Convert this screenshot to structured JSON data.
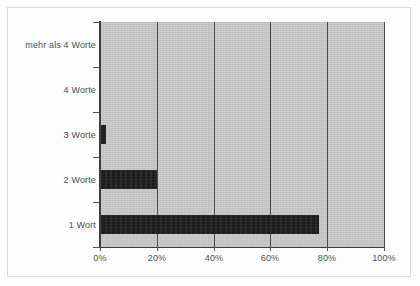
{
  "chart_data": {
    "type": "bar",
    "orientation": "horizontal",
    "title": "",
    "subtitle": "",
    "xlabel": "",
    "ylabel": "",
    "categories": [
      "1 Wort",
      "2 Worte",
      "3 Worte",
      "4 Worte",
      "mehr als 4 Worte"
    ],
    "values": [
      77,
      20,
      2,
      0,
      0
    ],
    "value_unit": "%",
    "xlim": [
      0,
      100
    ],
    "xticks": [
      0,
      20,
      40,
      60,
      80,
      100
    ],
    "xtick_labels": [
      "0%",
      "20%",
      "40%",
      "60%",
      "80%",
      "100%"
    ],
    "grid": "vertical",
    "legend": "none",
    "series": [
      {
        "name": "Anteil",
        "values": [
          77,
          20,
          2,
          0,
          0
        ]
      }
    ],
    "colors": {
      "bar": "#1c1c1c",
      "plot_background": "#c9c9c9",
      "gridline": "#4a4a4a",
      "axis": "#3c3c3c",
      "tick_label": "#4f4f4f",
      "figure_background": "#fdfdfd"
    }
  },
  "axis": {
    "y_categories": [
      {
        "label": "mehr als 4 Worte",
        "value": 0
      },
      {
        "label": "4 Worte",
        "value": 0
      },
      {
        "label": "3 Worte",
        "value": 2
      },
      {
        "label": "2 Worte",
        "value": 20
      },
      {
        "label": "1 Wort",
        "value": 77
      }
    ],
    "x_ticks": [
      {
        "label": "0%",
        "value": 0
      },
      {
        "label": "20%",
        "value": 20
      },
      {
        "label": "40%",
        "value": 40
      },
      {
        "label": "60%",
        "value": 60
      },
      {
        "label": "80%",
        "value": 80
      },
      {
        "label": "100%",
        "value": 100
      }
    ]
  }
}
